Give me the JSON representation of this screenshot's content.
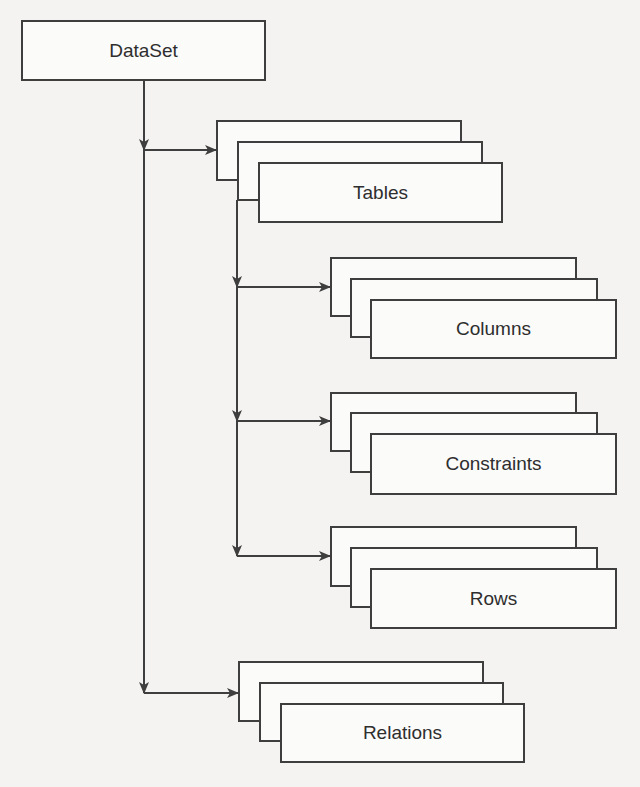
{
  "diagram": {
    "root": {
      "label": "DataSet"
    },
    "nodes": [
      {
        "id": "tables",
        "label": "Tables",
        "parent": "DataSet"
      },
      {
        "id": "columns",
        "label": "Columns",
        "parent": "Tables"
      },
      {
        "id": "constraints",
        "label": "Constraints",
        "parent": "Tables"
      },
      {
        "id": "rows",
        "label": "Rows",
        "parent": "Tables"
      },
      {
        "id": "relations",
        "label": "Relations",
        "parent": "DataSet"
      }
    ],
    "colors": {
      "line": "#3e3e3e",
      "box_fill": "#fbfbfa",
      "background": "#f4f3f1"
    }
  }
}
